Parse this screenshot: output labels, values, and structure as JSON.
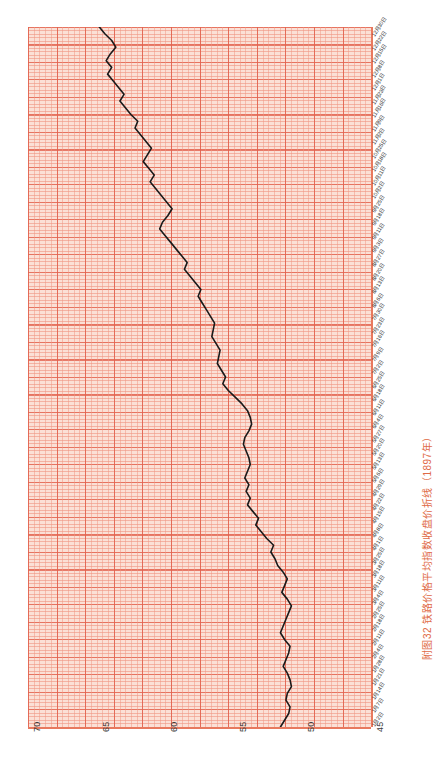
{
  "caption": "附图32  铁路价格平均指数收盘价折线（1897年）",
  "colors": {
    "paper_bg": "#fbe0d6",
    "grid_minor": "#f09682",
    "grid_major": "#e15f4b",
    "axis": "#e8795e",
    "series_line": "#1a1a1a",
    "caption": "#e06a46",
    "tick_text": "#2e2e2e"
  },
  "chart_data": {
    "type": "line",
    "title": "附图32  铁路价格平均指数收盘价折线（1897年）",
    "subtitle": "",
    "xlabel": "",
    "ylabel": "",
    "orientation": "rotated-90-ccw",
    "grid": true,
    "legend": "none",
    "ylim": [
      45,
      70
    ],
    "value_ticks": [
      70,
      65,
      60,
      55,
      50,
      45
    ],
    "xlim_labels": [
      "1月2日",
      "12月30日"
    ],
    "date_ticks": [
      "12月30日",
      "12月22日",
      "12月15日",
      "12月8日",
      "12月1日",
      "11月23日",
      "11月16日",
      "11月9日",
      "11月2日",
      "10月25日",
      "10月18日",
      "10月11日",
      "10月2日",
      "9月25日",
      "9月18日",
      "9月11日",
      "9月3日",
      "8月27日",
      "8月20日",
      "8月13日",
      "8月6日",
      "7月30日",
      "7月23日",
      "7月16日",
      "7月9日",
      "7月2日",
      "6月25日",
      "6月18日",
      "6月11日",
      "6月4日",
      "5月27日",
      "5月20日",
      "5月13日",
      "5月6日",
      "4月29日",
      "4月22日",
      "4月15日",
      "4月8日",
      "4月1日",
      "3月25日",
      "3月18日",
      "3月11日",
      "3月4日",
      "2月25日",
      "2月18日",
      "2月11日",
      "2月4日",
      "1月28日",
      "1月21日",
      "1月14日",
      "1月7日",
      "1月2日"
    ],
    "categories": [
      "1月2日",
      "1月5日",
      "1月8日",
      "1月12日",
      "1月15日",
      "1月19日",
      "1月22日",
      "1月26日",
      "1月29日",
      "2月2日",
      "2月5日",
      "2月9日",
      "2月12日",
      "2月16日",
      "2月19日",
      "2月23日",
      "2月26日",
      "3月2日",
      "3月5日",
      "3月9日",
      "3月12日",
      "3月16日",
      "3月19日",
      "3月23日",
      "3月26日",
      "3月30日",
      "4月2日",
      "4月6日",
      "4月9日",
      "4月13日",
      "4月16日",
      "4月20日",
      "4月23日",
      "4月27日",
      "4月30日",
      "5月4日",
      "5月7日",
      "5月11日",
      "5月14日",
      "5月18日",
      "5月21日",
      "5月25日",
      "5月28日",
      "6月1日",
      "6月4日",
      "6月8日",
      "6月11日",
      "6月15日",
      "6月18日",
      "6月22日",
      "6月25日",
      "6月29日",
      "7月2日",
      "7月6日",
      "7月9日",
      "7月13日",
      "7月16日",
      "7月20日",
      "7月23日",
      "7月27日",
      "7月30日",
      "8月3日",
      "8月6日",
      "8月10日",
      "8月13日",
      "8月17日",
      "8月20日",
      "8月24日",
      "8月27日",
      "8月31日",
      "9月3日",
      "9月7日",
      "9月10日",
      "9月14日",
      "9月17日",
      "9月21日",
      "9月24日",
      "9月28日",
      "10月1日",
      "10月5日",
      "10月8日",
      "10月12日",
      "10月15日",
      "10月19日",
      "10月22日",
      "10月26日",
      "10月29日",
      "11月2日",
      "11月5日",
      "11月9日",
      "11月12日",
      "11月16日",
      "11月19日",
      "11月23日",
      "11月26日",
      "11月30日",
      "12月3日",
      "12月7日",
      "12月10日",
      "12月14日",
      "12月17日",
      "12月21日",
      "12月24日",
      "12月28日",
      "12月30日"
    ],
    "values": [
      51.6,
      51.3,
      51.0,
      50.9,
      51.2,
      51.1,
      50.8,
      50.9,
      51.1,
      51.4,
      51.2,
      51.0,
      50.9,
      51.3,
      51.6,
      51.4,
      51.2,
      51.0,
      50.8,
      51.1,
      51.5,
      51.3,
      51.1,
      51.4,
      51.8,
      52.0,
      52.3,
      52.1,
      52.6,
      53.0,
      53.4,
      53.2,
      53.6,
      54.0,
      53.8,
      54.1,
      53.9,
      54.2,
      54.0,
      53.8,
      53.9,
      54.1,
      54.3,
      54.2,
      53.9,
      53.7,
      53.8,
      54.0,
      54.4,
      54.9,
      55.4,
      55.8,
      55.6,
      55.9,
      56.2,
      56.1,
      56.0,
      56.3,
      56.6,
      56.5,
      56.4,
      56.7,
      57.0,
      57.3,
      57.6,
      57.4,
      57.8,
      58.2,
      58.6,
      58.4,
      58.8,
      59.2,
      59.6,
      60.0,
      60.4,
      60.2,
      59.8,
      59.5,
      59.9,
      60.3,
      60.7,
      61.1,
      60.8,
      61.2,
      61.6,
      61.3,
      61.0,
      61.4,
      61.8,
      62.2,
      62.0,
      62.5,
      62.9,
      63.3,
      63.0,
      63.4,
      63.8,
      64.2,
      63.9,
      64.3,
      64.0,
      63.6,
      63.9,
      64.4,
      64.8
    ]
  }
}
